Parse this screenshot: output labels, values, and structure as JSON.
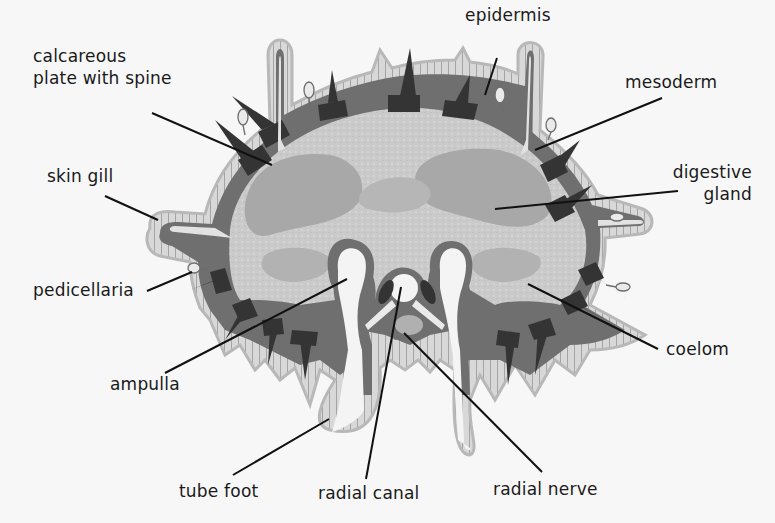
{
  "diagram": {
    "colors": {
      "background": "#f7f7f7",
      "epidermis": "#d2d2d2",
      "epidermis_cell_edge": "#8a8a8a",
      "mesoderm": "#6e6e6e",
      "plates": "#333333",
      "coelom": "#c8c8c8",
      "digestive_gland": "#a9a9a9",
      "canals": "#f4f4f4",
      "nerve": "#b0b0b0",
      "leader_line": "#111111",
      "text": "#1a1a1a"
    },
    "labels": {
      "calcareous_plate": [
        "calcareous",
        "plate with spine"
      ],
      "epidermis": "epidermis",
      "mesoderm": "mesoderm",
      "skin_gill": "skin gill",
      "digestive_gland": [
        "digestive",
        "gland"
      ],
      "pedicellaria": "pedicellaria",
      "ampulla": "ampulla",
      "coelom": "coelom",
      "tube_foot": "tube foot",
      "radial_canal": "radial canal",
      "radial_nerve": "radial nerve"
    }
  }
}
